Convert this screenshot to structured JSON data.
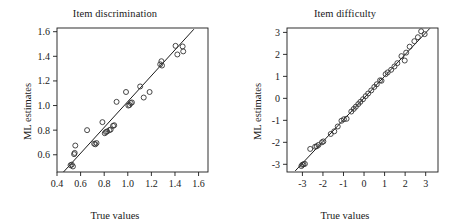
{
  "figure": {
    "width": 460,
    "height": 224,
    "background": "#ffffff",
    "ink_color": "#1a1a1a",
    "marker_color": "#333333"
  },
  "chart_data": [
    {
      "type": "scatter",
      "panel_index": 0,
      "title": "Item discrimination",
      "xlabel": "True values",
      "ylabel": "ML estimates",
      "xlim": [
        0.4,
        1.68
      ],
      "ylim": [
        0.46,
        1.63
      ],
      "xticks": [
        0.4,
        0.6,
        0.8,
        1.0,
        1.2,
        1.4,
        1.6
      ],
      "xticklabels": [
        "0.4",
        "0.6",
        "0.8",
        "1.0",
        "1.2",
        "1.4",
        "1.6"
      ],
      "yticks": [
        0.6,
        0.8,
        1.0,
        1.2,
        1.4,
        1.6
      ],
      "yticklabels": [
        "0.6",
        "0.8",
        "1.0",
        "1.2",
        "1.4",
        "1.6"
      ],
      "grid": false,
      "legend": "none",
      "marker": "open-circle",
      "reference_line": {
        "type": "identity-fit",
        "x": [
          0.455,
          1.56
        ],
        "y": [
          0.46,
          1.62
        ]
      },
      "points": [
        {
          "x": 0.515,
          "y": 0.515
        },
        {
          "x": 0.525,
          "y": 0.52
        },
        {
          "x": 0.535,
          "y": 0.505
        },
        {
          "x": 0.545,
          "y": 0.605
        },
        {
          "x": 0.55,
          "y": 0.615
        },
        {
          "x": 0.555,
          "y": 0.675
        },
        {
          "x": 0.655,
          "y": 0.8
        },
        {
          "x": 0.715,
          "y": 0.69
        },
        {
          "x": 0.725,
          "y": 0.685
        },
        {
          "x": 0.735,
          "y": 0.695
        },
        {
          "x": 0.785,
          "y": 0.865
        },
        {
          "x": 0.805,
          "y": 0.775
        },
        {
          "x": 0.815,
          "y": 0.785
        },
        {
          "x": 0.825,
          "y": 0.79
        },
        {
          "x": 0.845,
          "y": 0.8
        },
        {
          "x": 0.855,
          "y": 0.805
        },
        {
          "x": 0.875,
          "y": 0.835
        },
        {
          "x": 0.885,
          "y": 0.84
        },
        {
          "x": 0.905,
          "y": 1.03
        },
        {
          "x": 0.985,
          "y": 1.11
        },
        {
          "x": 1.005,
          "y": 1.0
        },
        {
          "x": 1.015,
          "y": 1.005
        },
        {
          "x": 1.025,
          "y": 1.02
        },
        {
          "x": 1.035,
          "y": 1.025
        },
        {
          "x": 1.105,
          "y": 1.155
        },
        {
          "x": 1.135,
          "y": 1.065
        },
        {
          "x": 1.185,
          "y": 1.11
        },
        {
          "x": 1.275,
          "y": 1.335
        },
        {
          "x": 1.285,
          "y": 1.36
        },
        {
          "x": 1.29,
          "y": 1.325
        },
        {
          "x": 1.405,
          "y": 1.485
        },
        {
          "x": 1.42,
          "y": 1.415
        },
        {
          "x": 1.465,
          "y": 1.48
        },
        {
          "x": 1.47,
          "y": 1.44
        }
      ]
    },
    {
      "type": "scatter",
      "panel_index": 1,
      "title": "Item difficulty",
      "xlabel": "True values",
      "ylabel": "ML estimates",
      "xlim": [
        -3.75,
        3.6
      ],
      "ylim": [
        -3.35,
        3.2
      ],
      "xticks": [
        -3,
        -2,
        -1,
        0,
        1,
        2,
        3
      ],
      "xticklabels": [
        "-3",
        "-2",
        "-1",
        "0",
        "1",
        "2",
        "3"
      ],
      "yticks": [
        -3,
        -2,
        -1,
        0,
        1,
        2,
        3
      ],
      "yticklabels": [
        "-3",
        "-2",
        "-1",
        "0",
        "1",
        "2",
        "3"
      ],
      "grid": false,
      "legend": "none",
      "marker": "open-circle",
      "reference_line": {
        "type": "identity-fit",
        "x": [
          -3.35,
          3.2
        ],
        "y": [
          -3.3,
          3.18
        ]
      },
      "points": [
        {
          "x": -3.05,
          "y": -3.08
        },
        {
          "x": -3.0,
          "y": -3.02
        },
        {
          "x": -2.95,
          "y": -3.0
        },
        {
          "x": -2.88,
          "y": -2.98
        },
        {
          "x": -2.62,
          "y": -2.3
        },
        {
          "x": -2.38,
          "y": -2.2
        },
        {
          "x": -2.3,
          "y": -2.18
        },
        {
          "x": -2.22,
          "y": -2.12
        },
        {
          "x": -2.05,
          "y": -2.0
        },
        {
          "x": -1.98,
          "y": -1.96
        },
        {
          "x": -1.62,
          "y": -1.62
        },
        {
          "x": -1.45,
          "y": -1.5
        },
        {
          "x": -1.28,
          "y": -1.28
        },
        {
          "x": -1.1,
          "y": -1.02
        },
        {
          "x": -0.98,
          "y": -0.95
        },
        {
          "x": -0.85,
          "y": -0.93
        },
        {
          "x": -0.62,
          "y": -0.6
        },
        {
          "x": -0.5,
          "y": -0.48
        },
        {
          "x": -0.4,
          "y": -0.38
        },
        {
          "x": -0.28,
          "y": -0.26
        },
        {
          "x": -0.18,
          "y": -0.16
        },
        {
          "x": -0.05,
          "y": -0.04
        },
        {
          "x": 0.08,
          "y": 0.1
        },
        {
          "x": 0.2,
          "y": 0.22
        },
        {
          "x": 0.35,
          "y": 0.36
        },
        {
          "x": 0.5,
          "y": 0.52
        },
        {
          "x": 0.62,
          "y": 0.64
        },
        {
          "x": 0.78,
          "y": 0.82
        },
        {
          "x": 0.85,
          "y": 0.8
        },
        {
          "x": 1.05,
          "y": 1.1
        },
        {
          "x": 1.15,
          "y": 1.18
        },
        {
          "x": 1.32,
          "y": 1.3
        },
        {
          "x": 1.48,
          "y": 1.45
        },
        {
          "x": 1.62,
          "y": 1.6
        },
        {
          "x": 1.82,
          "y": 1.92
        },
        {
          "x": 1.98,
          "y": 1.72
        },
        {
          "x": 2.05,
          "y": 2.08
        },
        {
          "x": 2.22,
          "y": 2.35
        },
        {
          "x": 2.45,
          "y": 2.6
        },
        {
          "x": 2.62,
          "y": 2.78
        },
        {
          "x": 2.78,
          "y": 3.05
        },
        {
          "x": 2.95,
          "y": 2.92
        }
      ]
    }
  ]
}
